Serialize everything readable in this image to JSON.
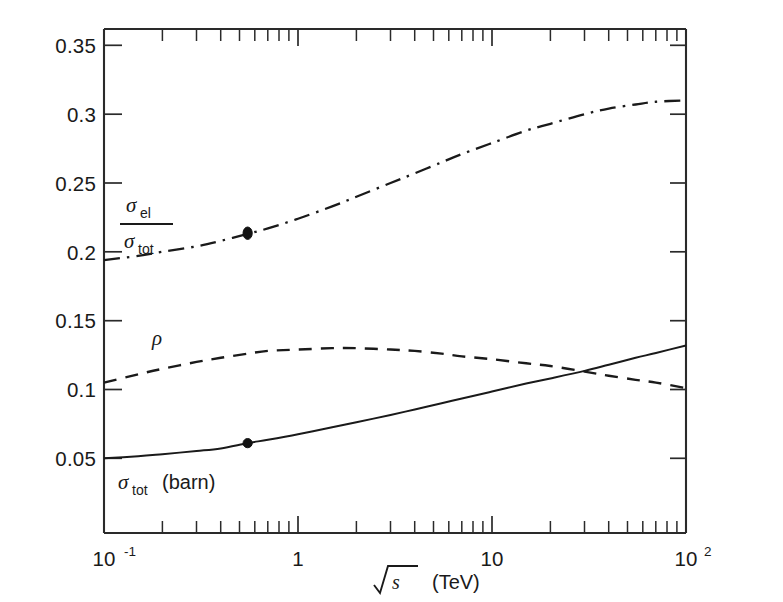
{
  "figure": {
    "caption_title": "",
    "background_color": "#ffffff",
    "ink_color": "#1a1a1a"
  },
  "axes": {
    "x": {
      "label_math": "√s",
      "label_units": "(TeV)",
      "label_sqrt_arg": "s",
      "scale": "log",
      "range": [
        0.1,
        100
      ],
      "tick_labels": [
        "10",
        "1",
        "10",
        "10"
      ],
      "tick_label_0_base": "10",
      "tick_label_0_exp": "-1",
      "tick_label_1": "1",
      "tick_label_2": "10",
      "tick_label_3_base": "10",
      "tick_label_3_exp": "2"
    },
    "y": {
      "label": "",
      "scale": "linear",
      "range": [
        0.0,
        0.35
      ],
      "tick_labels": [
        "0.35",
        "0.3",
        "0.25",
        "0.2",
        "0.15",
        "0.1",
        "0.05"
      ],
      "tick_values": [
        0.35,
        0.3,
        0.25,
        0.2,
        0.15,
        0.1,
        0.05
      ]
    }
  },
  "labels": {
    "ratio_numerator_sigma": "σ",
    "ratio_numerator_sub": "el",
    "ratio_denominator_sigma": "σ",
    "ratio_denominator_sub": "tot",
    "rho": "ρ",
    "sigma_tot_sigma": "σ",
    "sigma_tot_sub": "tot",
    "sigma_tot_units": "(barn)"
  },
  "chart_data": {
    "type": "line",
    "title": "",
    "xlabel": "√s (TeV)",
    "ylabel": "",
    "xscale": "log",
    "yscale": "linear",
    "xlim": [
      0.1,
      100
    ],
    "ylim": [
      0.0,
      0.35
    ],
    "grid": false,
    "legend_position": "inline-annotations",
    "series": [
      {
        "name": "σ_el/σ_tot",
        "style": "dash-dot",
        "x": [
          0.1,
          0.15,
          0.2,
          0.3,
          0.4,
          0.55,
          0.7,
          1.0,
          1.5,
          2.0,
          3.0,
          4.0,
          5.5,
          7.0,
          10.0,
          15.0,
          20.0,
          30.0,
          40.0,
          55.0,
          70.0,
          100.0
        ],
        "y": [
          0.194,
          0.197,
          0.2,
          0.204,
          0.208,
          0.213,
          0.217,
          0.224,
          0.233,
          0.24,
          0.25,
          0.257,
          0.265,
          0.271,
          0.279,
          0.288,
          0.293,
          0.3,
          0.304,
          0.307,
          0.309,
          0.31
        ]
      },
      {
        "name": "ρ",
        "style": "dashed",
        "x": [
          0.1,
          0.15,
          0.2,
          0.3,
          0.4,
          0.55,
          0.7,
          1.0,
          1.5,
          2.0,
          3.0,
          4.0,
          5.5,
          7.0,
          10.0,
          15.0,
          20.0,
          30.0,
          40.0,
          55.0,
          70.0,
          100.0
        ],
        "y": [
          0.105,
          0.111,
          0.115,
          0.12,
          0.123,
          0.126,
          0.128,
          0.129,
          0.13,
          0.13,
          0.129,
          0.128,
          0.126,
          0.124,
          0.122,
          0.119,
          0.117,
          0.113,
          0.11,
          0.107,
          0.105,
          0.101
        ]
      },
      {
        "name": "σ_tot (barn)",
        "style": "solid",
        "x": [
          0.1,
          0.15,
          0.2,
          0.3,
          0.4,
          0.55,
          0.7,
          1.0,
          1.5,
          2.0,
          3.0,
          4.0,
          5.5,
          7.0,
          10.0,
          15.0,
          20.0,
          30.0,
          40.0,
          55.0,
          70.0,
          100.0
        ],
        "y": [
          0.05,
          0.0515,
          0.053,
          0.0553,
          0.0572,
          0.061,
          0.0635,
          0.0675,
          0.0725,
          0.0762,
          0.0815,
          0.0855,
          0.09,
          0.0935,
          0.0985,
          0.1043,
          0.108,
          0.1135,
          0.118,
          0.123,
          0.1265,
          0.132
        ]
      }
    ],
    "points": [
      {
        "series": "σ_el/σ_tot",
        "x": 0.55,
        "y": 0.2135,
        "marker": "filled-circle"
      },
      {
        "series": "σ_tot (barn)",
        "x": 0.55,
        "y": 0.061,
        "marker": "filled-circle"
      }
    ]
  }
}
